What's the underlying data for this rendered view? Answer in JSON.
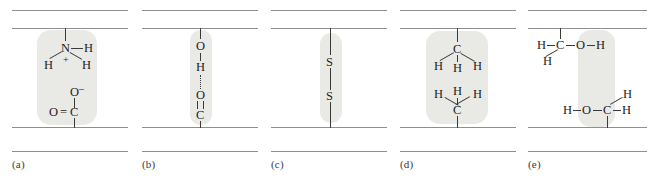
{
  "figure": {
    "background_color": "#ffffff",
    "shade_color": "#e9e9e6",
    "chain_color": "#8f8f8f",
    "atom_color": "#1d1d1d"
  },
  "panels": [
    {
      "id": "panel-a",
      "label": "(a)",
      "interaction": "ionic-bond",
      "atoms": [
        {
          "name": "nitrogen",
          "text": "N"
        },
        {
          "name": "hydrogen-right",
          "text": "H"
        },
        {
          "name": "hydrogen-left",
          "text": "H"
        },
        {
          "name": "hydrogen-lower",
          "text": "H"
        },
        {
          "name": "positive-charge",
          "text": "+"
        },
        {
          "name": "oxygen-anion",
          "text": "O"
        },
        {
          "name": "oxygen-anion-charge",
          "text": "–"
        },
        {
          "name": "oxygen-double",
          "text": "O"
        },
        {
          "name": "double-bond-symbol",
          "text": "="
        },
        {
          "name": "carbon",
          "text": "C"
        }
      ]
    },
    {
      "id": "panel-b",
      "label": "(b)",
      "interaction": "hydrogen-bond",
      "atoms": [
        {
          "name": "oxygen-donor",
          "text": "O"
        },
        {
          "name": "hydrogen",
          "text": "H"
        },
        {
          "name": "oxygen-acceptor",
          "text": "O"
        },
        {
          "name": "carbon",
          "text": "C"
        }
      ]
    },
    {
      "id": "panel-c",
      "label": "(c)",
      "interaction": "disulfide-bond",
      "atoms": [
        {
          "name": "sulfur-upper",
          "text": "S"
        },
        {
          "name": "sulfur-lower",
          "text": "S"
        }
      ]
    },
    {
      "id": "panel-d",
      "label": "(d)",
      "interaction": "hydrophobic-interaction",
      "atoms": [
        {
          "name": "carbon-upper",
          "text": "C"
        },
        {
          "name": "hydrogen-upper-left",
          "text": "H"
        },
        {
          "name": "hydrogen-upper-mid",
          "text": "H"
        },
        {
          "name": "hydrogen-upper-right",
          "text": "H"
        },
        {
          "name": "hydrogen-lower-left",
          "text": "H"
        },
        {
          "name": "hydrogen-lower-mid",
          "text": "H"
        },
        {
          "name": "hydrogen-lower-right",
          "text": "H"
        },
        {
          "name": "carbon-lower",
          "text": "C"
        }
      ]
    },
    {
      "id": "panel-e",
      "label": "(e)",
      "interaction": "hydrogen-bond-hydroxyl",
      "atoms": [
        {
          "name": "hydrogen-top-left",
          "text": "H"
        },
        {
          "name": "carbon-top",
          "text": "C"
        },
        {
          "name": "oxygen-top",
          "text": "O"
        },
        {
          "name": "hydrogen-top-right",
          "text": "H"
        },
        {
          "name": "hydrogen-top-below",
          "text": "H"
        },
        {
          "name": "hydrogen-bottom-left",
          "text": "H"
        },
        {
          "name": "oxygen-bottom",
          "text": "O"
        },
        {
          "name": "carbon-bottom",
          "text": "C"
        },
        {
          "name": "hydrogen-bottom-right",
          "text": "H"
        },
        {
          "name": "hydrogen-bottom-above",
          "text": "H"
        }
      ]
    }
  ]
}
